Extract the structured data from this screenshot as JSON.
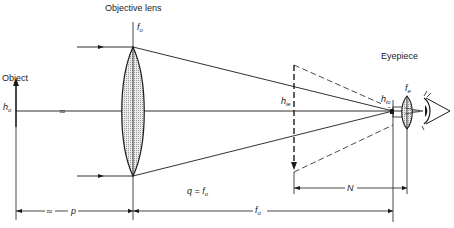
{
  "diagram": {
    "type": "optical telescope / compound lens ray diagram",
    "labels": {
      "objective_lens": "Objective lens",
      "objective_focal": {
        "main": "f",
        "sub": "o"
      },
      "object": "Object",
      "object_height": {
        "main": "h",
        "sub": "o"
      },
      "eyepiece": "Eyepiece",
      "eyepiece_focal": {
        "main": "f",
        "sub": "e"
      },
      "intermediate_image_height": {
        "main": "h",
        "sub": "ie"
      },
      "image_height_eyepiece": {
        "main": "h",
        "sub": "io"
      },
      "q_equals": {
        "main": "q = f",
        "sub": "o"
      },
      "distance_p": "p",
      "distance_N": "N",
      "distance_fo": {
        "main": "f",
        "sub": "o"
      },
      "break_symbol": "≈"
    },
    "colors": {
      "line": "#1a1a1a",
      "lens_fill": "#d8d8d8",
      "background": "#ffffff"
    }
  }
}
